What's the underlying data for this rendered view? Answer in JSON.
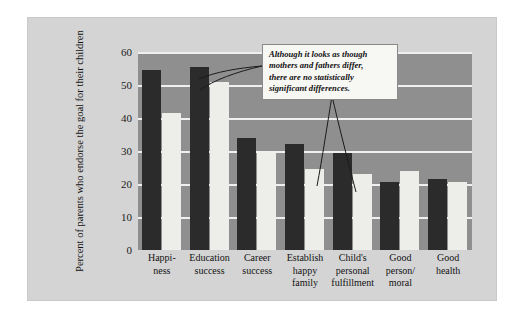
{
  "chart_data": {
    "type": "bar",
    "title": "",
    "xlabel": "",
    "ylabel": "Percent of parents who endorse the goal for their children",
    "ylim": [
      0,
      60
    ],
    "yticks": [
      0,
      10,
      20,
      30,
      40,
      50,
      60
    ],
    "grid": true,
    "legend_position": "top-right",
    "categories": [
      "Happi-\nness",
      "Education\nsuccess",
      "Career\nsuccess",
      "Establish\nhappy\nfamily",
      "Child's\npersonal\nfulfillment",
      "Good\nperson/\nmoral",
      "Good\nhealth"
    ],
    "category_lines": [
      [
        "Happi-",
        "ness"
      ],
      [
        "Education",
        "success"
      ],
      [
        "Career",
        "success"
      ],
      [
        "Establish",
        "happy",
        "family"
      ],
      [
        "Child's",
        "personal",
        "fulfillment"
      ],
      [
        "Good",
        "person/",
        "moral"
      ],
      [
        "Good",
        "health"
      ]
    ],
    "series": [
      {
        "name": "Mothers",
        "color": "#2b2b2b",
        "values": [
          54.5,
          55.5,
          34,
          32,
          29.5,
          20.5,
          21.5
        ]
      },
      {
        "name": "Fathers",
        "color": "#ededea",
        "values": [
          41.5,
          51,
          29.5,
          24.5,
          23,
          24,
          20.5
        ]
      }
    ],
    "annotations": [
      {
        "id": "significance-note",
        "text": "Although it looks as though mothers and fathers differ, there are no statistically significant differences.",
        "lines": [
          "Although it looks as though",
          "mothers and fathers differ,",
          "there are no statistically",
          "significant differences."
        ]
      }
    ]
  },
  "legend": {
    "items": [
      {
        "label": "Mothers",
        "swatch": "mothers"
      },
      {
        "label": "Fathers",
        "swatch": "fathers"
      }
    ]
  },
  "colors": {
    "page_background": "#ffffff",
    "figure_panel": "#d4d4d4",
    "plot_background": "#8f8f8f",
    "gridline": "#efefef",
    "mothers_bar": "#2b2b2b",
    "fathers_bar": "#ededea",
    "callout_background": "#f7f7f4",
    "callout_border": "#8a8a8a",
    "text": "#111111"
  }
}
